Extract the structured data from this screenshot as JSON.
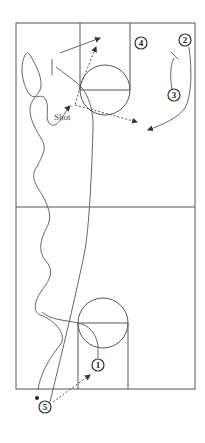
{
  "diagram": {
    "type": "basketball-play",
    "labels": {
      "shot": "Shot"
    },
    "players": [
      {
        "id": "1",
        "x": 98,
        "y": 365
      },
      {
        "id": "2",
        "x": 185,
        "y": 40
      },
      {
        "id": "3",
        "x": 174,
        "y": 95
      },
      {
        "id": "4",
        "x": 141,
        "y": 43
      },
      {
        "id": "5",
        "x": 45,
        "y": 407
      }
    ],
    "colors": {
      "line": "#555555",
      "background": "#ffffff"
    }
  }
}
